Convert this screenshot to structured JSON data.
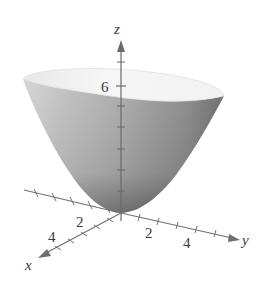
{
  "figure": {
    "type": "3d-surface-plot",
    "surface": "elliptic paraboloid (bowl opening upward)",
    "colors": {
      "surface_light": "#f2f2f2",
      "surface_mid": "#b9b9b9",
      "surface_dark": "#5e5e5e",
      "axis": "#6f6f6f",
      "label": "#3a3a3a"
    },
    "axes": {
      "x": {
        "label": "x",
        "tick_labels": [
          "2",
          "4"
        ]
      },
      "y": {
        "label": "y",
        "tick_labels": [
          "2",
          "4"
        ]
      },
      "z": {
        "label": "z",
        "tick_labels": [
          "6"
        ]
      }
    }
  }
}
